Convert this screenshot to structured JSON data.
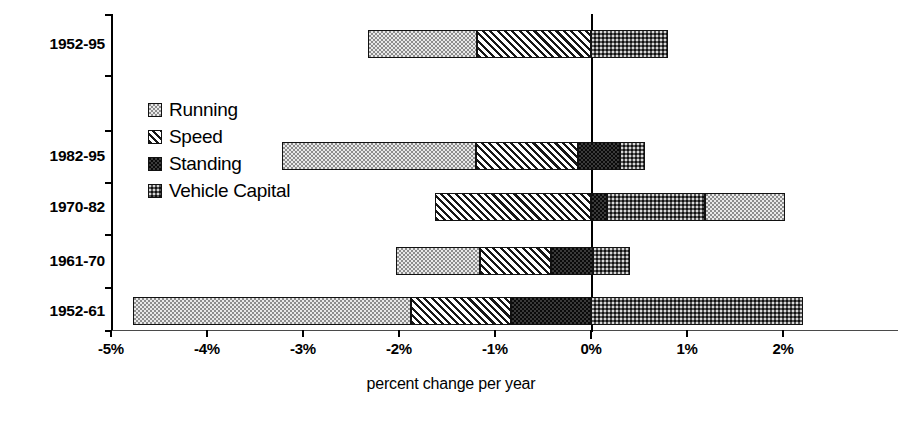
{
  "chart_data": {
    "type": "bar",
    "orientation": "horizontal",
    "stacked": true,
    "title": "",
    "xlabel": "percent change per year",
    "ylabel": "",
    "xlim": [
      -5,
      2.5
    ],
    "xticks": [
      -5,
      -4,
      -3,
      -2,
      -1,
      0,
      1,
      2
    ],
    "xticklabels": [
      "-5%",
      "-4%",
      "-3%",
      "-2%",
      "-1%",
      "0%",
      "1%",
      "2%"
    ],
    "grid": false,
    "zero_reference_line": true,
    "legend_position": "inside-upper-left",
    "categories": [
      "1952-95",
      "1982-95",
      "1970-82",
      "1961-70",
      "1952-61"
    ],
    "series": [
      {
        "name": "Running",
        "values": [
          -1.13,
          -2.02,
          0.83,
          -0.87,
          -2.89
        ]
      },
      {
        "name": "Speed",
        "values": [
          -1.19,
          -1.06,
          -1.62,
          -0.74,
          -1.05
        ]
      },
      {
        "name": "Standing",
        "values": [
          0.0,
          0.44,
          0.17,
          0.44,
          -0.83
        ]
      },
      {
        "name": "Vehicle Capital",
        "values": [
          0.8,
          0.26,
          1.02,
          0.39,
          2.21
        ]
      }
    ],
    "bars": [
      {
        "category": "1952-95",
        "total_negative": -2.32,
        "total_positive": 0.8,
        "segments": [
          {
            "name": "Running",
            "start": -2.32,
            "end": -1.19
          },
          {
            "name": "Speed",
            "start": -1.19,
            "end": 0.0
          },
          {
            "name": "Vehicle Capital",
            "start": 0.0,
            "end": 0.8
          }
        ]
      },
      {
        "category": "1982-95",
        "total_negative": -3.22,
        "total_positive": 0.56,
        "segments": [
          {
            "name": "Running",
            "start": -3.22,
            "end": -1.2
          },
          {
            "name": "Speed",
            "start": -1.2,
            "end": -0.14
          },
          {
            "name": "Standing",
            "start": -0.14,
            "end": 0.3
          },
          {
            "name": "Vehicle Capital",
            "start": 0.3,
            "end": 0.56
          }
        ]
      },
      {
        "category": "1970-82",
        "total_negative": -1.62,
        "total_positive": 2.02,
        "segments": [
          {
            "name": "Speed",
            "start": -1.62,
            "end": 0.0
          },
          {
            "name": "Standing",
            "start": 0.0,
            "end": 0.17
          },
          {
            "name": "Vehicle Capital",
            "start": 0.17,
            "end": 1.19
          },
          {
            "name": "Running",
            "start": 1.19,
            "end": 2.02
          }
        ]
      },
      {
        "category": "1961-70",
        "total_negative": -2.03,
        "total_positive": 0.41,
        "segments": [
          {
            "name": "Running",
            "start": -2.03,
            "end": -1.16
          },
          {
            "name": "Speed",
            "start": -1.16,
            "end": -0.42
          },
          {
            "name": "Standing",
            "start": -0.42,
            "end": 0.02
          },
          {
            "name": "Vehicle Capital",
            "start": 0.02,
            "end": 0.41
          }
        ]
      },
      {
        "category": "1952-61",
        "total_negative": -4.77,
        "total_positive": 2.21,
        "segments": [
          {
            "name": "Running",
            "start": -4.77,
            "end": -1.88
          },
          {
            "name": "Speed",
            "start": -1.88,
            "end": -0.83
          },
          {
            "name": "Standing",
            "start": -0.83,
            "end": 0.0
          },
          {
            "name": "Vehicle Capital",
            "start": 0.0,
            "end": 2.21
          }
        ]
      }
    ],
    "legend": [
      {
        "label": "Running",
        "pattern": "light-dotted"
      },
      {
        "label": "Speed",
        "pattern": "diagonal-hatch"
      },
      {
        "label": "Standing",
        "pattern": "dark-checker"
      },
      {
        "label": "Vehicle Capital",
        "pattern": "medium-checker"
      }
    ]
  },
  "axis": {
    "x_title": "percent change per year",
    "x_tick_labels": [
      "-5%",
      "-4%",
      "-3%",
      "-2%",
      "-1%",
      "0%",
      "1%",
      "2%"
    ],
    "y_tick_labels": [
      "1952-95",
      "1982-95",
      "1970-82",
      "1961-70",
      "1952-61"
    ]
  }
}
